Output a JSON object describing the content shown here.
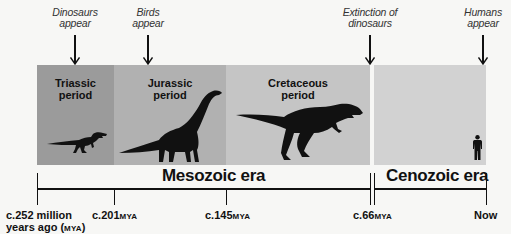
{
  "events": [
    {
      "label_line1": "Dinosaurs",
      "label_line2": "appear",
      "x": 75
    },
    {
      "label_line1": "Birds",
      "label_line2": "appear",
      "x": 148
    },
    {
      "label_line1": "Extinction of",
      "label_line2": "dinosaurs",
      "x": 370
    },
    {
      "label_line1": "Humans",
      "label_line2": "appear",
      "x": 483
    }
  ],
  "periods": [
    {
      "name_line1": "Triassic",
      "name_line2": "period",
      "color": "#9b9b9b",
      "animal": "small-theropod"
    },
    {
      "name_line1": "Jurassic",
      "name_line2": "period",
      "color": "#b1b1b1",
      "animal": "sauropod"
    },
    {
      "name_line1": "Cretaceous",
      "name_line2": "period",
      "color": "#c5c5c5",
      "animal": "tyrannosaur"
    },
    {
      "name_line1": "",
      "name_line2": "",
      "color": "#d2d2d2",
      "animal": "human"
    }
  ],
  "eras": [
    {
      "name": "Mesozoic era"
    },
    {
      "name": "Cenozoic era"
    }
  ],
  "dates": [
    {
      "value": "c.252 million",
      "line2": "years ago (",
      "unit": "MYA",
      "line2_end": ")"
    },
    {
      "value": "c.201",
      "unit": "MYA"
    },
    {
      "value": "c.145",
      "unit": "MYA"
    },
    {
      "value": "c.66",
      "unit": "MYA"
    },
    {
      "value": "Now",
      "unit": ""
    }
  ]
}
